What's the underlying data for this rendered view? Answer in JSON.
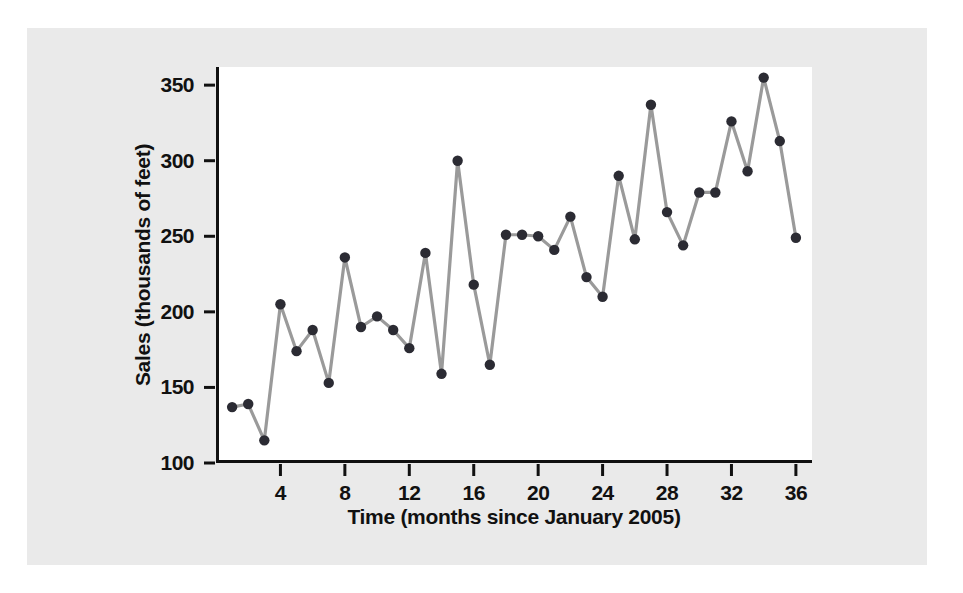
{
  "figure": {
    "panel_background": "#eaeaea",
    "page_background": "#ffffff",
    "plot_background": "#ffffff",
    "axis_color": "#111111"
  },
  "chart_data": {
    "type": "line",
    "title": "",
    "subtitle": "",
    "xlabel": "Time (months since January 2005)",
    "ylabel": "Sales (thousands of feet)",
    "xlim": [
      0,
      37
    ],
    "ylim": [
      100,
      362
    ],
    "grid": false,
    "legend": null,
    "marker": "filled-circle",
    "marker_color": "#2b2b33",
    "line_color": "#9a9a9a",
    "xticks": [
      4,
      8,
      12,
      16,
      20,
      24,
      28,
      32,
      36
    ],
    "xtick_labels": [
      "4",
      "8",
      "12",
      "16",
      "20",
      "24",
      "28",
      "32",
      "36"
    ],
    "yticks": [
      100,
      150,
      200,
      250,
      300,
      350
    ],
    "ytick_labels": [
      "100",
      "150",
      "200",
      "250",
      "300",
      "350"
    ],
    "x": [
      1,
      2,
      3,
      4,
      5,
      6,
      7,
      8,
      9,
      10,
      11,
      12,
      13,
      14,
      15,
      16,
      17,
      18,
      19,
      20,
      21,
      22,
      23,
      24,
      25,
      26,
      27,
      28,
      29,
      30,
      31,
      32,
      33,
      34,
      35,
      36
    ],
    "values": [
      137,
      139,
      115,
      205,
      174,
      188,
      153,
      236,
      190,
      197,
      188,
      176,
      239,
      159,
      300,
      218,
      165,
      251,
      251,
      250,
      241,
      263,
      223,
      210,
      290,
      248,
      337,
      266,
      244,
      279,
      279,
      326,
      293,
      355,
      313,
      249
    ],
    "series": [
      {
        "name": "Sales",
        "values": [
          137,
          139,
          115,
          205,
          174,
          188,
          153,
          236,
          190,
          197,
          188,
          176,
          239,
          159,
          300,
          218,
          165,
          251,
          251,
          250,
          241,
          263,
          223,
          210,
          290,
          248,
          337,
          266,
          244,
          279,
          279,
          326,
          293,
          355,
          313,
          249
        ]
      }
    ]
  }
}
